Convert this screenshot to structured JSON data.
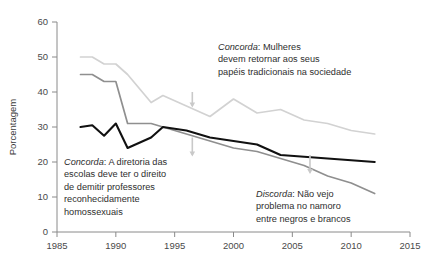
{
  "chart_data": {
    "type": "line",
    "title": "",
    "xlabel": "",
    "ylabel": "Porcentagem",
    "xlim": [
      1985,
      2015
    ],
    "ylim": [
      0,
      60
    ],
    "xticks": [
      1985,
      1990,
      1995,
      2000,
      2005,
      2010,
      2015
    ],
    "yticks": [
      0,
      10,
      20,
      30,
      40,
      50,
      60
    ],
    "grid": false,
    "legend_position": "annotations-inline",
    "series": [
      {
        "name": "Concorda: Mulheres devem retornar aos seus papéis tradicionais na sociedade",
        "color": "#d2d2d2",
        "x": [
          1987,
          1988,
          1989,
          1990,
          1991,
          1993,
          1994,
          1996,
          1998,
          2000,
          2002,
          2004,
          2006,
          2008,
          2010,
          2012
        ],
        "values": [
          50,
          50,
          48,
          48,
          45,
          37,
          39,
          36,
          33,
          38,
          34,
          35,
          32,
          31,
          29,
          28
        ]
      },
      {
        "name": "Discorda: Não vejo problema no namoro entre negros e brancos",
        "color": "#8f8f8f",
        "x": [
          1987,
          1988,
          1989,
          1990,
          1991,
          1993,
          1994,
          1996,
          1998,
          2000,
          2002,
          2004,
          2006,
          2008,
          2010,
          2012
        ],
        "values": [
          45,
          45,
          43,
          43,
          31,
          31,
          30,
          28,
          26,
          24,
          23,
          21,
          19,
          16,
          14,
          11
        ]
      },
      {
        "name": "Concorda: A diretoria das escolas deve ter o direito de demitir professores reconhecidamente homossexuais",
        "color": "#111111",
        "x": [
          1987,
          1988,
          1989,
          1990,
          1991,
          1993,
          1994,
          1996,
          1998,
          2000,
          2002,
          2004,
          2006,
          2008,
          2010,
          2012
        ],
        "values": [
          30,
          30.5,
          27.5,
          31,
          24,
          27,
          30,
          29,
          27,
          26,
          25,
          22,
          21.5,
          21,
          20.5,
          20
        ]
      }
    ],
    "annotations": [
      {
        "id": "women",
        "lead": "Concorda",
        "text": ": Mulheres\ndevem retornar aos seus\npapéis tradicionais na sociedade"
      },
      {
        "id": "schools",
        "lead": "Concorda",
        "text": ": A diretoria das\nescolas deve ter o direito\nde demitir professores\nreconhecidamente\nhomossexuais"
      },
      {
        "id": "dating",
        "lead": "Discorda",
        "text": ": Não vejo\nproblema no namoro\nentre negros e brancos"
      }
    ],
    "pointer_arrows": [
      {
        "name": "arrow-to-women-line",
        "x": 1996.5,
        "y_top": 36,
        "y_bottom": 40
      },
      {
        "name": "arrow-to-schools-line",
        "x": 1996.5,
        "y_top": 22,
        "y_bottom": 27
      },
      {
        "name": "arrow-to-schools-line-right",
        "x": 2006.5,
        "y_top": 17,
        "y_bottom": 22
      }
    ]
  },
  "axis": {
    "y_title": "Porcentagem",
    "x_tick_labels": [
      "1985",
      "1990",
      "1995",
      "2000",
      "2005",
      "2010",
      "2015"
    ],
    "y_tick_labels": [
      "0",
      "10",
      "20",
      "30",
      "40",
      "50",
      "60"
    ]
  },
  "colors": {
    "axis": "#8a8a8a",
    "series_light": "#d2d2d2",
    "series_mid": "#8f8f8f",
    "series_dark": "#111111",
    "arrow": "#c9c9c9",
    "text": "#2e2e2e"
  }
}
